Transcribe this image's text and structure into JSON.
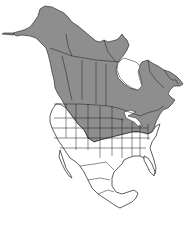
{
  "map": {
    "title": "Range map of North America",
    "region": "North America",
    "legend": [],
    "colors": {
      "range_fill": "#8e8e8e",
      "land_fill": "#ffffff",
      "outline": "#1a1a1a",
      "background": "#ffffff"
    },
    "range_description": "Shaded range covers Alaska, most of Canada (excluding far north and Hudson Bay), and the northern-central and northeastern United States including the Great Lakes region and New England"
  }
}
